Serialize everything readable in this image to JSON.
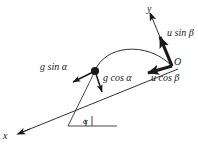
{
  "figure": {
    "kind": "physics-diagram",
    "background_color": "#ffffff",
    "stroke_color": "#1a1a1a"
  },
  "axes": {
    "x_label": "x",
    "y_label": "y",
    "origin_label": "O"
  },
  "angles": {
    "incline_label": "α"
  },
  "vectors": {
    "u_sin_beta": "u sin β",
    "u_cos_beta": "u cos β",
    "g_sin_alpha": "g sin α",
    "g_cos_alpha": "g cos α"
  },
  "elements": {
    "particle_label": "particle",
    "trajectory_label": "trajectory-arc",
    "incline_label": "incline-line",
    "horizontal_label": "horizontal-reference-line"
  }
}
